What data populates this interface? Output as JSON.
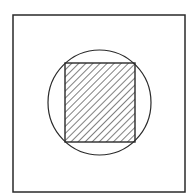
{
  "diagram": {
    "colors": {
      "stroke": "#2a2a2a",
      "background": "#ffffff",
      "hatch": "#3a3a3a"
    },
    "outer_square": {
      "x": 13,
      "y": 15,
      "width": 172,
      "height": 177
    },
    "circle": {
      "cx": 99.5,
      "cy": 102.5,
      "rx": 51.5,
      "ry": 52.5
    },
    "inner_square": {
      "x": 65,
      "y": 63,
      "width": 70,
      "height": 79,
      "fill": "diagonal-hatch"
    }
  }
}
